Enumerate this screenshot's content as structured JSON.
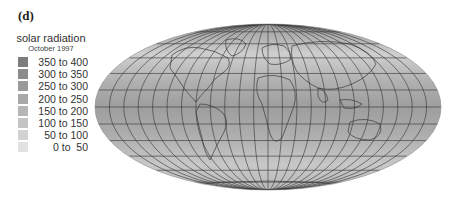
{
  "panel_label": "(d)",
  "legend": {
    "title": "solar radiation",
    "subtitle": "October 1997",
    "items": [
      {
        "label": "350 to 400",
        "color": "#7d7d7d"
      },
      {
        "label": "300 to 350",
        "color": "#8c8c8c"
      },
      {
        "label": "250 to 300",
        "color": "#9a9a9a"
      },
      {
        "label": "200 to 250",
        "color": "#a9a9a9"
      },
      {
        "label": "150 to 200",
        "color": "#b6b6b6"
      },
      {
        "label": "100 to 150",
        "color": "#c4c4c4"
      },
      {
        "label": "50 to 100",
        "color": "#d2d2d2"
      },
      {
        "label": "0 to  50",
        "color": "#e2e2e2"
      }
    ]
  },
  "map": {
    "projection": "Mollweide",
    "center_x": 268,
    "center_y": 107,
    "radius_x": 173,
    "radius_y": 83,
    "fill_color": "#a8a8a8",
    "grid_color": "#333333",
    "meridian_step_deg": 15,
    "parallel_step_deg": 15
  }
}
